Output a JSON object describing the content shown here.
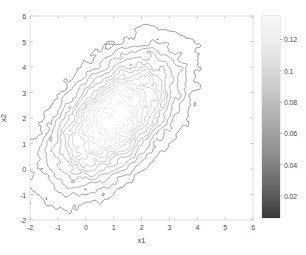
{
  "figure": {
    "background_color": "#ffffff",
    "plot_area": {
      "left": 30,
      "top": 16,
      "right": 253,
      "bottom": 220
    }
  },
  "chart_data": {
    "type": "contour",
    "title": "",
    "subtitle": "",
    "xlabel": "x1",
    "ylabel": "x2",
    "xlim": [
      -2,
      6
    ],
    "ylim": [
      -2,
      6
    ],
    "xticks": [
      "-2",
      "-1",
      "0",
      "1",
      "2",
      "3",
      "4",
      "5",
      "6"
    ],
    "xtick_values": [
      -2,
      -1,
      0,
      1,
      2,
      3,
      4,
      5,
      6
    ],
    "yticks": [
      "-2",
      "-1",
      "0",
      "1",
      "2",
      "3",
      "4",
      "5",
      "6"
    ],
    "ytick_values": [
      -2,
      -1,
      0,
      1,
      2,
      3,
      4,
      5,
      6
    ],
    "grid": false,
    "legend": null,
    "colormap": "gray-inverted",
    "line_color": "#555555",
    "density_center": [
      1.0,
      2.0
    ],
    "density_sigma_x": 1.35,
    "density_sigma_y": 1.55,
    "density_correlation": 0.55,
    "density_peak": 0.135,
    "contour_levels": [
      0.01,
      0.02,
      0.03,
      0.04,
      0.05,
      0.06,
      0.07,
      0.08,
      0.09,
      0.1,
      0.11,
      0.12,
      0.13
    ],
    "noise_amplitude": 0.016,
    "colorbar": {
      "position": "right",
      "vmin": 0.006,
      "vmax": 0.135,
      "orientation": "vertical",
      "bounds": {
        "left": 262,
        "top": 16,
        "width": 18,
        "height": 202
      },
      "ticks": [
        {
          "label": "0.12",
          "value": 0.12
        },
        {
          "label": "0.1",
          "value": 0.1
        },
        {
          "label": "0.08",
          "value": 0.08
        },
        {
          "label": "0.06",
          "value": 0.06
        },
        {
          "label": "0.04",
          "value": 0.04
        },
        {
          "label": "0.02",
          "value": 0.02
        }
      ],
      "gradient_top_color": "#f5f5f5",
      "gradient_bottom_color": "#3a3a3a"
    }
  }
}
